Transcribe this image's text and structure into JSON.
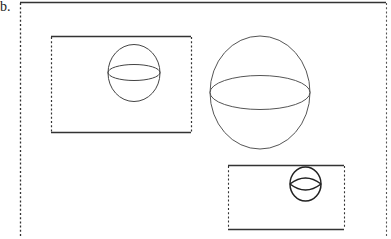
{
  "figure": {
    "label": "b.",
    "stroke_color": "#333333",
    "background": "#ffffff"
  },
  "diagram": {
    "outer_frame": {
      "x": 20,
      "y": 2,
      "width": 366,
      "height": 236,
      "top": "solid",
      "sides": "dashed",
      "bottom": "none"
    },
    "rectangles": [
      {
        "name": "left-rectangle",
        "x": 51,
        "y": 36,
        "width": 140,
        "height": 96,
        "horizontal": "solid",
        "vertical": "dashed"
      },
      {
        "name": "bottom-right-rectangle",
        "x": 228,
        "y": 165,
        "width": 116,
        "height": 64,
        "horizontal": "solid",
        "vertical": "dashed"
      }
    ],
    "spheres": [
      {
        "name": "small-sphere-in-left-rectangle",
        "cx": 134,
        "cy": 73,
        "rx": 26,
        "ry": 28,
        "equator_ry": 8
      },
      {
        "name": "large-free-sphere",
        "cx": 260,
        "cy": 92,
        "rx": 50,
        "ry": 57,
        "equator_ry": 17
      },
      {
        "name": "tiny-sphere-in-bottom-rectangle",
        "cx": 305,
        "cy": 184,
        "rx": 16,
        "ry": 17,
        "equator_ry": 6
      }
    ]
  }
}
